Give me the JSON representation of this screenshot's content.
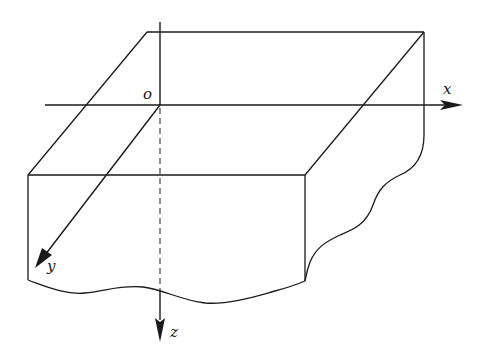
{
  "figure": {
    "origin_label": "o",
    "axes": [
      {
        "name": "x",
        "label": "x",
        "direction": "right"
      },
      {
        "name": "y",
        "label": "y",
        "direction": "front-left (oblique)"
      },
      {
        "name": "z",
        "label": "z",
        "direction": "down"
      }
    ],
    "colors": {
      "line": "#1a1a1a",
      "background": "#ffffff"
    }
  }
}
